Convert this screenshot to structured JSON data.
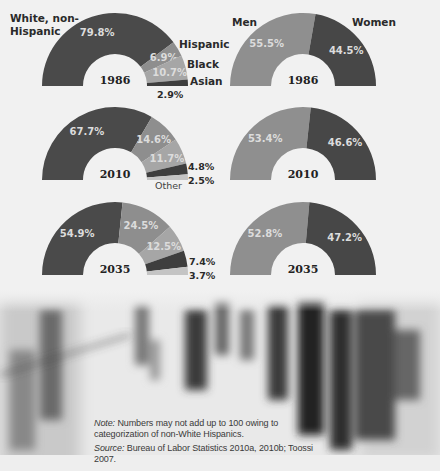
{
  "colors": {
    "white_non_hispanic": "#4a4a4a",
    "hispanic": "#8e8e8e",
    "black": "#a6a6a6",
    "asian": "#3e3e3e",
    "other": "#c4c4c4",
    "men": "#8f8f8f",
    "women": "#474747"
  },
  "labels": {
    "white_non_hispanic_line1": "White, non-",
    "white_non_hispanic_line2": "Hispanic",
    "hispanic": "Hispanic",
    "black": "Black",
    "asian": "Asian",
    "other": "Other",
    "men": "Men",
    "women": "Women"
  },
  "note": {
    "note_label": "Note:",
    "note_text": " Numbers may not add up to 100 owing to categorization of non-White Hispanics.",
    "source_label": "Source:",
    "source_text": " Bureau of Labor Statistics 2010a, 2010b; Toossi 2007."
  },
  "chart_data": [
    {
      "type": "pie",
      "subtype": "semicircle-donut",
      "title": "1986",
      "categories": [
        "White, non-Hispanic",
        "Hispanic",
        "Black",
        "Asian"
      ],
      "values": [
        79.8,
        6.9,
        10.7,
        2.9
      ],
      "value_labels": [
        "79.8%",
        "6.9%",
        "10.7%",
        "2.9%"
      ]
    },
    {
      "type": "pie",
      "subtype": "semicircle-donut",
      "title": "1986",
      "categories": [
        "Men",
        "Women"
      ],
      "values": [
        55.5,
        44.5
      ],
      "value_labels": [
        "55.5%",
        "44.5%"
      ]
    },
    {
      "type": "pie",
      "subtype": "semicircle-donut",
      "title": "2010",
      "categories": [
        "White, non-Hispanic",
        "Hispanic",
        "Black",
        "Asian",
        "Other"
      ],
      "values": [
        67.7,
        14.6,
        11.7,
        4.8,
        2.5
      ],
      "value_labels": [
        "67.7%",
        "14.6%",
        "11.7%",
        "4.8%",
        "2.5%"
      ]
    },
    {
      "type": "pie",
      "subtype": "semicircle-donut",
      "title": "2010",
      "categories": [
        "Men",
        "Women"
      ],
      "values": [
        53.4,
        46.6
      ],
      "value_labels": [
        "53.4%",
        "46.6%"
      ]
    },
    {
      "type": "pie",
      "subtype": "semicircle-donut",
      "title": "2035",
      "categories": [
        "White, non-Hispanic",
        "Hispanic",
        "Black",
        "Asian",
        "Other"
      ],
      "values": [
        54.9,
        24.5,
        12.5,
        7.4,
        3.7
      ],
      "value_labels": [
        "54.9%",
        "24.5%",
        "12.5%",
        "7.4%",
        "3.7%"
      ]
    },
    {
      "type": "pie",
      "subtype": "semicircle-donut",
      "title": "2035",
      "categories": [
        "Men",
        "Women"
      ],
      "values": [
        52.8,
        47.2
      ],
      "value_labels": [
        "52.8%",
        "47.2%"
      ]
    }
  ]
}
